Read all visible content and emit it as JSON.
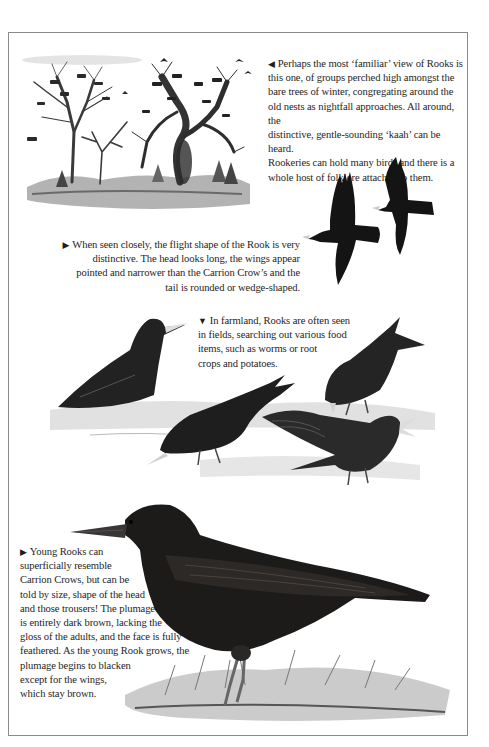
{
  "page": {
    "subject": "Rook",
    "border_color": "#8a8a8a",
    "ink_color": "#1a1a1a"
  },
  "captions": {
    "rookery": {
      "arrow": "◀",
      "lines": [
        "Perhaps the most ‘familiar’ view of Rooks is",
        "this one, of groups perched high amongst the",
        "bare trees of winter, congregating around the",
        "old nests as nightfall approaches. All around, the",
        "distinctive, gentle-sounding ‘kaah’ can be heard.",
        "Rookeries can hold many birds and there is a",
        "whole host of folklore attached to them."
      ]
    },
    "flight": {
      "arrow": "▶",
      "lines": [
        "When seen closely, the flight shape of the Rook is very",
        "distinctive. The head looks long, the wings appear",
        "pointed and narrower than the Carrion Crow’s and the",
        "tail is rounded or wedge-shaped."
      ]
    },
    "farmland": {
      "arrow": "▼",
      "lines": [
        "In farmland, Rooks are often seen",
        "in fields, searching out various food",
        "items, such as worms or root",
        "crops and potatoes."
      ]
    },
    "young": {
      "arrow": "▶",
      "lines": [
        "Young Rooks can",
        "superficially resemble",
        "Carrion Crows, but can be",
        "told by size, shape of the head",
        "and those trousers! The plumage",
        "is entirely dark brown, lacking the",
        "gloss of the adults, and the face is fully",
        "feathered. As the young Rook grows, the",
        "plumage begins to blacken",
        "except for the wings,",
        "which stay brown."
      ]
    }
  },
  "illustrations": {
    "rookery": "rookery-trees-illustration",
    "flight": "two-flying-rooks-illustration",
    "farmland": "four-feeding-rooks-illustration",
    "young": "young-rook-standing-illustration"
  }
}
